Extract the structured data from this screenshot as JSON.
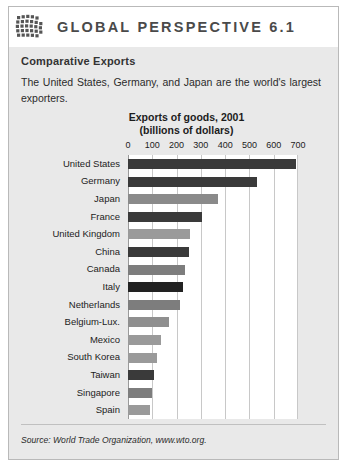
{
  "header": {
    "logo_icon": "globe-grid-icon",
    "title": "GLOBAL PERSPECTIVE 6.1"
  },
  "box": {
    "subtitle": "Comparative Exports",
    "intro": "The United States, Germany, and Japan are the world's largest exporters.",
    "source": "Source: World Trade Organization, www.wto.org."
  },
  "colors": {
    "panel_background": "#e9e9e9",
    "panel_border": "#b9b9b9",
    "header_background": "#ffffff",
    "header_text": "#4a4a4a",
    "plot_background": "#ffffff",
    "gridline": "#c8c8c8",
    "bar_dark": "#3a3a3a",
    "bar_light": "#8a8a8a",
    "text": "#1c1c1c"
  },
  "chart_data": {
    "type": "bar",
    "orientation": "horizontal",
    "title": "Exports of goods, 2001",
    "subtitle": "(billions of dollars)",
    "xlabel": "",
    "ylabel": "",
    "xlim": [
      0,
      700
    ],
    "tick_labels": [
      "0",
      "100",
      "200",
      "300",
      "400",
      "500",
      "600",
      "700"
    ],
    "ticks": [
      0,
      100,
      200,
      300,
      400,
      500,
      600,
      700
    ],
    "grid": true,
    "legend": null,
    "categories": [
      "United States",
      "Germany",
      "Japan",
      "France",
      "United Kingdom",
      "China",
      "Canada",
      "Italy",
      "Netherlands",
      "Belgium-Lux.",
      "Mexico",
      "South Korea",
      "Taiwan",
      "Singapore",
      "Spain"
    ],
    "values": [
      690,
      530,
      370,
      305,
      255,
      250,
      235,
      225,
      215,
      168,
      135,
      118,
      107,
      100,
      90
    ],
    "bar_colors": [
      "#3a3a3a",
      "#3a3a3a",
      "#8a8a8a",
      "#3a3a3a",
      "#9a9a9a",
      "#3a3a3a",
      "#7d7d7d",
      "#222222",
      "#7d7d7d",
      "#8f8f8f",
      "#9a9a9a",
      "#9a9a9a",
      "#3a3a3a",
      "#7d7d7d",
      "#9a9a9a"
    ]
  }
}
